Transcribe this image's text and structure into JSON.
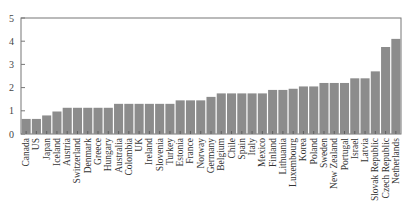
{
  "chart_data": {
    "type": "bar",
    "title": "",
    "xlabel": "",
    "ylabel": "",
    "ylim": [
      0,
      5
    ],
    "yticks": [
      0,
      1,
      2,
      3,
      4,
      5
    ],
    "grid": false,
    "legend": null,
    "bar_color": "#8c8c8c",
    "categories": [
      "Canada",
      "US",
      "Japan",
      "Iceland",
      "Austria",
      "Switzerland",
      "Denmark",
      "Greece",
      "Hungary",
      "Australia",
      "Colombia",
      "UK",
      "Ireland",
      "Slovenia",
      "Turkey",
      "Estonia",
      "France",
      "Norway",
      "Germany",
      "Belgium",
      "Chile",
      "Spain",
      "Italy",
      "Mexico",
      "Finland",
      "Lithuania",
      "Luxembourg",
      "Korea",
      "Poland",
      "Sweden",
      "New Zealand",
      "Portugal",
      "Israel",
      "Latvia",
      "Slovak Republic",
      "Czech Republic",
      "Netherlands"
    ],
    "values": [
      0.65,
      0.65,
      0.8,
      0.97,
      1.13,
      1.13,
      1.13,
      1.13,
      1.13,
      1.3,
      1.3,
      1.3,
      1.3,
      1.3,
      1.3,
      1.45,
      1.45,
      1.45,
      1.6,
      1.75,
      1.75,
      1.75,
      1.75,
      1.75,
      1.9,
      1.9,
      1.95,
      2.05,
      2.05,
      2.2,
      2.2,
      2.2,
      2.4,
      2.4,
      2.7,
      3.75,
      4.1
    ]
  }
}
